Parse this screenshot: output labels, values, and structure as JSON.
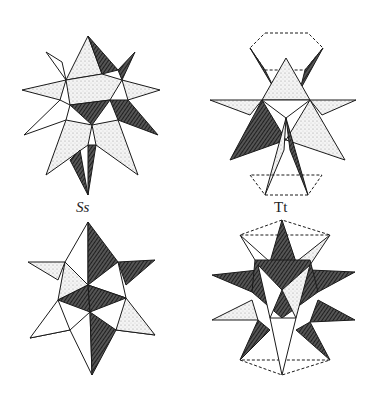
{
  "figure": {
    "labels": {
      "top_left": "Ss",
      "top_right": "Tt"
    },
    "colors": {
      "ink": "#1a1a1a",
      "light": "#e6e6e6",
      "mid": "#9a9a9a",
      "dark": "#2a2a2a",
      "paper": "#ffffff"
    }
  }
}
